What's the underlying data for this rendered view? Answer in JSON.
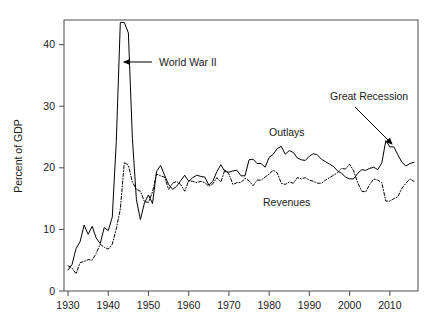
{
  "chart_data": {
    "type": "line",
    "title": "",
    "subtitle": "",
    "xlabel": "",
    "ylabel": "Percent of GDP",
    "xlim": [
      1929,
      2017
    ],
    "ylim": [
      0,
      44
    ],
    "grid": false,
    "legend_position": "inline-annotations",
    "x_ticks": [
      "1930",
      "1940",
      "1950",
      "1960",
      "1970",
      "1980",
      "1990",
      "2000",
      "2010"
    ],
    "x_tick_values": [
      1930,
      1940,
      1950,
      1960,
      1970,
      1980,
      1990,
      2000,
      2010
    ],
    "y_ticks": [
      "0",
      "10",
      "20",
      "30",
      "40"
    ],
    "y_tick_values": [
      0,
      10,
      20,
      30,
      40
    ],
    "x": [
      1930,
      1931,
      1932,
      1933,
      1934,
      1935,
      1936,
      1937,
      1938,
      1939,
      1940,
      1941,
      1942,
      1943,
      1944,
      1945,
      1946,
      1947,
      1948,
      1949,
      1950,
      1951,
      1952,
      1953,
      1954,
      1955,
      1956,
      1957,
      1958,
      1959,
      1960,
      1961,
      1962,
      1963,
      1964,
      1965,
      1966,
      1967,
      1968,
      1969,
      1970,
      1971,
      1972,
      1973,
      1974,
      1975,
      1976,
      1977,
      1978,
      1979,
      1980,
      1981,
      1982,
      1983,
      1984,
      1985,
      1986,
      1987,
      1988,
      1989,
      1990,
      1991,
      1992,
      1993,
      1994,
      1995,
      1996,
      1997,
      1998,
      1999,
      2000,
      2001,
      2002,
      2003,
      2004,
      2005,
      2006,
      2007,
      2008,
      2009,
      2010,
      2011,
      2012,
      2013,
      2014,
      2015,
      2016
    ],
    "series": [
      {
        "name": "Outlays",
        "style": "solid",
        "color": "#000000",
        "values": [
          3.4,
          4.3,
          6.9,
          8.0,
          10.7,
          9.2,
          10.5,
          8.6,
          7.7,
          10.3,
          9.8,
          12.0,
          24.3,
          43.6,
          43.6,
          41.9,
          24.8,
          14.8,
          11.6,
          14.3,
          15.6,
          14.2,
          19.4,
          20.4,
          18.8,
          17.3,
          16.5,
          17.0,
          17.9,
          18.8,
          17.8,
          18.4,
          18.8,
          18.6,
          18.5,
          17.2,
          17.8,
          19.4,
          20.5,
          19.4,
          19.3,
          19.5,
          19.6,
          18.7,
          18.7,
          21.3,
          21.4,
          20.7,
          20.7,
          20.1,
          21.7,
          22.2,
          23.1,
          23.5,
          22.2,
          22.8,
          22.5,
          21.6,
          21.3,
          21.2,
          21.9,
          22.3,
          22.1,
          21.4,
          21.0,
          20.6,
          20.2,
          19.5,
          19.1,
          18.5,
          18.2,
          18.2,
          19.1,
          19.7,
          19.6,
          19.9,
          20.1,
          19.7,
          20.8,
          24.4,
          23.4,
          23.4,
          22.1,
          20.9,
          20.3,
          20.7,
          20.9
        ]
      },
      {
        "name": "Revenues",
        "style": "dashdot",
        "color": "#000000",
        "values": [
          4.1,
          3.7,
          2.8,
          4.6,
          4.8,
          5.1,
          5.0,
          6.1,
          7.6,
          7.1,
          6.8,
          7.6,
          10.1,
          13.3,
          20.9,
          20.4,
          17.7,
          16.5,
          16.2,
          14.5,
          14.4,
          16.1,
          19.0,
          18.7,
          18.5,
          16.5,
          17.5,
          17.8,
          17.3,
          16.2,
          17.9,
          17.8,
          17.6,
          17.8,
          17.6,
          17.0,
          17.4,
          18.4,
          17.7,
          19.7,
          19.0,
          17.3,
          17.6,
          17.6,
          18.3,
          17.9,
          17.1,
          18.0,
          18.0,
          18.5,
          19.0,
          19.6,
          19.2,
          17.5,
          17.3,
          17.7,
          17.5,
          18.4,
          18.2,
          18.4,
          18.0,
          17.8,
          17.5,
          17.5,
          18.0,
          18.4,
          18.8,
          19.2,
          19.9,
          19.8,
          20.6,
          19.5,
          17.6,
          16.2,
          16.1,
          17.3,
          18.2,
          18.0,
          17.6,
          14.6,
          14.6,
          15.0,
          15.3,
          16.7,
          17.5,
          18.2,
          17.8
        ]
      }
    ],
    "annotations": [
      {
        "text": "World War II",
        "x_text": 159,
        "y_text": 66,
        "arrow_from": [
          152,
          62
        ],
        "arrow_to": [
          124,
          62
        ]
      },
      {
        "text": "Great Recession",
        "x_text": 330,
        "y_text": 100,
        "arrow_from": [
          355,
          107
        ],
        "arrow_to": [
          392,
          144
        ]
      },
      {
        "text": "Outlays",
        "x_text": 269,
        "y_text": 136
      },
      {
        "text": "Revenues",
        "x_text": 263,
        "y_text": 206
      }
    ]
  },
  "axis": {
    "ylabel": "Percent of GDP"
  }
}
